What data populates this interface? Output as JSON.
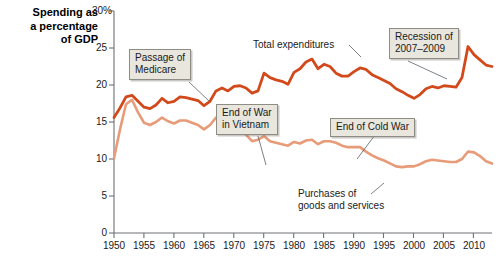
{
  "chart_data": {
    "type": "line",
    "title": "Spending as a percentage of GDP",
    "xlabel": "",
    "ylabel": "Spending as a percentage of GDP",
    "xlim": [
      1950,
      2013
    ],
    "ylim": [
      0,
      30
    ],
    "grid": false,
    "legend_position": "inline-annotations",
    "y_ticks": [
      "0",
      "5",
      "10",
      "15",
      "20",
      "25",
      "30%"
    ],
    "y_tick_values": [
      0,
      5,
      10,
      15,
      20,
      25,
      30
    ],
    "x_ticks": [
      "1950",
      "1955",
      "1960",
      "1965",
      "1970",
      "1975",
      "1980",
      "1985",
      "1990",
      "1995",
      "2000",
      "2005",
      "2010"
    ],
    "x_tick_values": [
      1950,
      1955,
      1960,
      1965,
      1970,
      1975,
      1980,
      1985,
      1990,
      1995,
      2000,
      2005,
      2010
    ],
    "x": [
      1950,
      1951,
      1952,
      1953,
      1954,
      1955,
      1956,
      1957,
      1958,
      1959,
      1960,
      1961,
      1962,
      1963,
      1964,
      1965,
      1966,
      1967,
      1968,
      1969,
      1970,
      1971,
      1972,
      1973,
      1974,
      1975,
      1976,
      1977,
      1978,
      1979,
      1980,
      1981,
      1982,
      1983,
      1984,
      1985,
      1986,
      1987,
      1988,
      1989,
      1990,
      1991,
      1992,
      1993,
      1994,
      1995,
      1996,
      1997,
      1998,
      1999,
      2000,
      2001,
      2002,
      2003,
      2004,
      2005,
      2006,
      2007,
      2008,
      2009,
      2010,
      2011,
      2012,
      2013
    ],
    "series": [
      {
        "name": "Total expenditures",
        "color": "#d2491b",
        "values": [
          15.6,
          16.9,
          18.4,
          18.6,
          17.8,
          17.0,
          16.8,
          17.3,
          18.2,
          17.6,
          17.8,
          18.4,
          18.3,
          18.1,
          17.9,
          17.2,
          17.8,
          19.2,
          19.6,
          19.2,
          19.8,
          19.9,
          19.6,
          18.9,
          19.2,
          21.6,
          21.0,
          20.7,
          20.5,
          20.1,
          21.7,
          22.2,
          23.1,
          23.5,
          22.2,
          22.8,
          22.5,
          21.6,
          21.2,
          21.2,
          21.8,
          22.3,
          22.1,
          21.4,
          21.0,
          20.6,
          20.2,
          19.5,
          19.1,
          18.6,
          18.2,
          18.7,
          19.5,
          19.8,
          19.6,
          19.9,
          19.8,
          19.7,
          21.0,
          25.2,
          24.1,
          23.4,
          22.7,
          22.5
        ]
      },
      {
        "name": "Purchases of goods and services",
        "color": "#e89b78",
        "values": [
          10.1,
          14.0,
          17.4,
          18.0,
          16.3,
          14.9,
          14.6,
          15.0,
          15.6,
          15.1,
          14.8,
          15.2,
          15.2,
          14.9,
          14.6,
          14.0,
          14.6,
          15.6,
          15.4,
          14.7,
          14.3,
          13.7,
          13.3,
          12.4,
          12.6,
          13.1,
          12.4,
          12.2,
          12.0,
          11.8,
          12.3,
          12.1,
          12.5,
          12.6,
          12.0,
          12.4,
          12.4,
          12.2,
          11.8,
          11.6,
          11.6,
          11.6,
          11.0,
          10.5,
          10.1,
          9.8,
          9.4,
          9.0,
          8.9,
          9.0,
          9.0,
          9.3,
          9.7,
          9.9,
          9.8,
          9.7,
          9.6,
          9.6,
          10.0,
          11.0,
          10.9,
          10.4,
          9.7,
          9.4
        ]
      }
    ],
    "annotations": [
      {
        "id": "passage-of-medicare",
        "text_lines": [
          "Passage of",
          "Medicare"
        ],
        "style": "callout",
        "target_year": 1965,
        "target_value": 19.0
      },
      {
        "id": "end-of-war-in-vietnam",
        "text_lines": [
          "End of War",
          "in Vietnam"
        ],
        "style": "callout",
        "target_year": 1975,
        "target_value": 13.1
      },
      {
        "id": "end-of-cold-war",
        "text_lines": [
          "End of Cold War"
        ],
        "style": "callout",
        "target_year": 1991,
        "target_value": 11.6
      },
      {
        "id": "recession-of-2007-2009",
        "text_lines": [
          "Recession of",
          "2007–2009"
        ],
        "style": "callout",
        "target_year": 2008,
        "target_value": 21.0
      },
      {
        "id": "total-expenditures",
        "text_lines": [
          "Total expenditures"
        ],
        "style": "plain",
        "target_year": 1983,
        "target_value": 23.5
      },
      {
        "id": "purchases-of-goods-and-services",
        "text_lines": [
          "Purchases of",
          "goods and services"
        ],
        "style": "plain",
        "target_year": 1999,
        "target_value": 9.0
      }
    ]
  },
  "chart": {
    "axis_title": "Spending as a percentage of GDP",
    "axis_title_lines": [
      "Spending as",
      "a percentage",
      "of GDP"
    ],
    "colors": {
      "total_expenditures": "#d2491b",
      "purchases": "#e89b78",
      "axis": "#6d7076",
      "callout_fill": "#e8e6dd",
      "callout_border": "#8d8d86",
      "leader_line": "#5a5f66"
    },
    "y_labels": {
      "t30": "30%",
      "t25": "25",
      "t20": "20",
      "t15": "15",
      "t10": "10",
      "t5": "5",
      "t0": "0"
    },
    "x_labels": {
      "x1950": "1950",
      "x1955": "1955",
      "x1960": "1960",
      "x1965": "1965",
      "x1970": "1970",
      "x1975": "1975",
      "x1980": "1980",
      "x1985": "1985",
      "x1990": "1990",
      "x1995": "1995",
      "x2000": "2000",
      "x2005": "2005",
      "x2010": "2010"
    },
    "callouts": {
      "medicare_l1": "Passage of",
      "medicare_l2": "Medicare",
      "vietnam_l1": "End of War",
      "vietnam_l2": "in Vietnam",
      "coldwar_l1": "End of Cold War",
      "recession_l1": "Recession of",
      "recession_l2": "2007–2009",
      "total_exp": "Total expenditures",
      "purchases_l1": "Purchases of",
      "purchases_l2": "goods and services"
    }
  }
}
